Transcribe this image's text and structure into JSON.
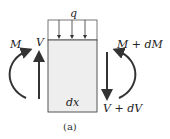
{
  "diagram": {
    "load_label": "q",
    "moment_left": "M",
    "shear_left": "V",
    "moment_right": "M + dM",
    "shear_right": "V + dV",
    "element_length": "dx",
    "caption": "(a)",
    "colors": {
      "element_fill": "#eeeeee",
      "stroke": "#333333",
      "background": "#ffffff"
    }
  }
}
